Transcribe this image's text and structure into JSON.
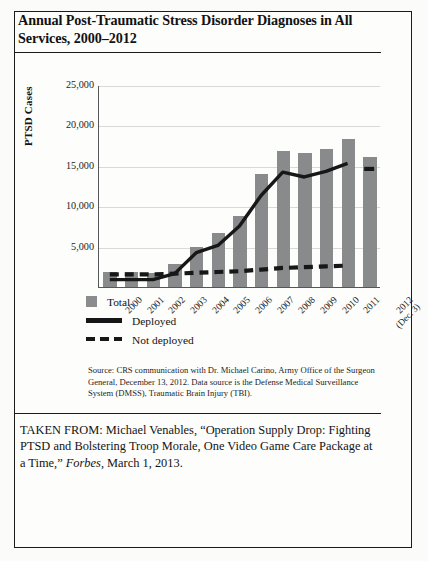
{
  "title": "Annual Post-Traumatic Stress Disorder Diagnoses in All Services, 2000–2012",
  "chart_data": {
    "type": "bar",
    "title": "Annual Post-Traumatic Stress Disorder Diagnoses in All Services, 2000–2012",
    "xlabel": "",
    "ylabel": "PTSD Cases",
    "ylim": [
      0,
      25000
    ],
    "ytick_labels": [
      "25,000",
      "20,000",
      "15,000",
      "10,000",
      "5,000",
      ""
    ],
    "ytick_values": [
      25000,
      20000,
      15000,
      10000,
      5000,
      0
    ],
    "grid": true,
    "legend_position": "below-left",
    "categories": [
      "2000",
      "2001",
      "2002",
      "2003",
      "2004",
      "2005",
      "2006",
      "2007",
      "2008",
      "2009",
      "2010",
      "2011",
      "2012"
    ],
    "category_sublabels": [
      "",
      "",
      "",
      "",
      "",
      "",
      "",
      "",
      "",
      "",
      "",
      "",
      "(Dec. 3)"
    ],
    "series": [
      {
        "name": "Total",
        "type": "bar",
        "color": "#888a8b",
        "values": [
          1800,
          1800,
          1750,
          2900,
          4900,
          6700,
          8800,
          14000,
          16800,
          16600,
          17100,
          18300,
          16100
        ]
      },
      {
        "name": "Deployed",
        "type": "line",
        "style": "solid",
        "color": "#171717",
        "values": [
          950,
          950,
          950,
          1700,
          4300,
          5200,
          7600,
          11400,
          14300,
          13700,
          14400,
          15400,
          null
        ]
      },
      {
        "name": "Not deployed",
        "type": "line",
        "style": "dashed",
        "color": "#171717",
        "values": [
          1600,
          1600,
          1600,
          1700,
          1800,
          1900,
          2000,
          2200,
          2400,
          2500,
          2600,
          2700,
          14700
        ]
      }
    ]
  },
  "legend": {
    "items": [
      {
        "label": "Total",
        "marker": "square-gray"
      },
      {
        "label": "Deployed",
        "marker": "solid-line"
      },
      {
        "label": "Not deployed",
        "marker": "dashed-line"
      }
    ]
  },
  "source_note": "Source: CRS communication with Dr. Michael Carino, Army Office of the Surgeon General, December 13, 2012. Data source is the Defense Medical Surveillance System (DMSS), Traumatic Brain Injury (TBI).",
  "taken_from": {
    "prefix": "TAKEN FROM: Michael Venables, “Operation Supply Drop: Fighting PTSD and Bolstering Troop Morale, One Video Game Care Package at a Time,” ",
    "publication": "Forbes",
    "suffix": ", March 1, 2013."
  }
}
